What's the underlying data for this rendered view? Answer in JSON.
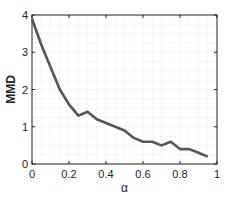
{
  "chart_data": {
    "type": "line",
    "title": "",
    "xlabel": "α",
    "ylabel": "MMD",
    "xlim": [
      0,
      1
    ],
    "ylim": [
      0,
      4
    ],
    "xticks": [
      0,
      0.2,
      0.4,
      0.6,
      0.8,
      1
    ],
    "xtick_labels": [
      "0",
      "0.2",
      "0.4",
      "0.6",
      "0.8",
      "1"
    ],
    "yticks": [
      0,
      1,
      2,
      3,
      4
    ],
    "ytick_labels": [
      "0",
      "1",
      "2",
      "3",
      "4"
    ],
    "grid": true,
    "legend": null,
    "series": [
      {
        "name": "MMD",
        "color": "#555555",
        "x": [
          0,
          0.05,
          0.1,
          0.15,
          0.2,
          0.25,
          0.3,
          0.35,
          0.4,
          0.45,
          0.5,
          0.55,
          0.6,
          0.65,
          0.7,
          0.75,
          0.8,
          0.85,
          0.9,
          0.95
        ],
        "values": [
          3.9,
          3.2,
          2.6,
          2.0,
          1.6,
          1.3,
          1.4,
          1.2,
          1.1,
          1.0,
          0.9,
          0.7,
          0.6,
          0.6,
          0.5,
          0.6,
          0.4,
          0.4,
          0.3,
          0.2
        ]
      }
    ]
  },
  "colors": {
    "axis": "#222222",
    "grid": "#eeeeee",
    "line": "#555555"
  }
}
